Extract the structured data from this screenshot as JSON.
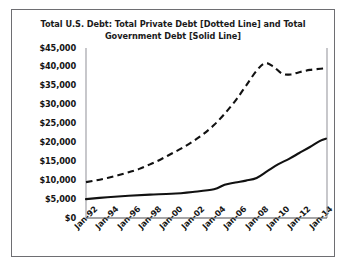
{
  "chart_data": {
    "type": "line",
    "title": "Total U.S. Debt: Total Private Debt [Dotted Line] and Total Government Debt [Solid Line]",
    "title_line1": "Total U.S. Debt: Total Private Debt [Dotted Line] and Total",
    "title_line2": "Government Debt [Solid Line]",
    "xlabel": "",
    "ylabel": "",
    "ylim": [
      0,
      45000
    ],
    "ytick_labels": [
      "$45,000",
      "$40,000",
      "$35,000",
      "$30,000",
      "$25,000",
      "$20,000",
      "$15,000",
      "$10,000",
      "$5,000",
      "$0"
    ],
    "ytick_values": [
      45000,
      40000,
      35000,
      30000,
      25000,
      20000,
      15000,
      10000,
      5000,
      0
    ],
    "categories": [
      "Jan-92",
      "Jan-94",
      "Jan-96",
      "Jan-98",
      "Jan-00",
      "Jan-02",
      "Jan-04",
      "Jan-06",
      "Jan-08",
      "Jan-10",
      "Jan-12",
      "Jan-14"
    ],
    "x": [
      1992,
      1994,
      1996,
      1998,
      2000,
      2002,
      2004,
      2006,
      2008,
      2010,
      2012,
      2014
    ],
    "xlim": [
      1992,
      2014.6
    ],
    "grid": false,
    "legend": "none",
    "series": [
      {
        "name": "Total Private Debt [Dotted Line]",
        "style": "dashed",
        "color": "#111111",
        "x": [
          1992,
          1993,
          1994,
          1995,
          1996,
          1997,
          1998,
          1999,
          2000,
          2001,
          2002,
          2003,
          2004,
          2005,
          2006,
          2007,
          2008,
          2008.8,
          2009.6,
          2010.4,
          2011.2,
          2012,
          2013,
          2014,
          2014.5
        ],
        "values": [
          9500,
          10000,
          10600,
          11300,
          12100,
          13000,
          14200,
          15500,
          17000,
          18500,
          20200,
          22200,
          24600,
          27600,
          31000,
          35000,
          39000,
          41000,
          40000,
          38200,
          38000,
          38600,
          39200,
          39500,
          39600
        ]
      },
      {
        "name": "Total Government Debt [Solid Line]",
        "style": "solid",
        "color": "#111111",
        "x": [
          1992,
          1994,
          1996,
          1998,
          2000,
          2002,
          2004,
          2005,
          2006,
          2007,
          2008,
          2009,
          2010,
          2011,
          2012,
          2013,
          2014,
          2014.5
        ],
        "values": [
          5000,
          5500,
          5900,
          6200,
          6400,
          6900,
          7600,
          8800,
          9400,
          9900,
          10600,
          12400,
          14200,
          15600,
          17200,
          18800,
          20500,
          21000
        ]
      }
    ]
  },
  "axes": {
    "left_px": 86,
    "right_px": 327,
    "top_px": 48,
    "bottom_px": 218
  }
}
